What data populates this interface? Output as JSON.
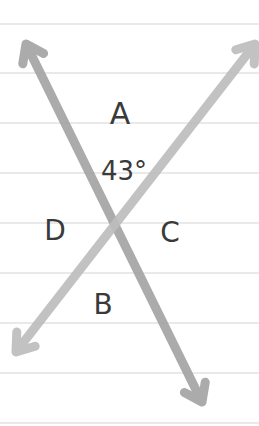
{
  "diagram": {
    "paper": {
      "background": "#ffffff",
      "rule_color": "#d4d4d4",
      "rule_y": [
        24,
        73,
        123,
        173,
        223,
        273,
        323,
        373,
        423
      ]
    },
    "lines": [
      {
        "name": "line-top-left-to-bottom-right",
        "from": [
          26,
          44
        ],
        "to": [
          202,
          402
        ],
        "color": "#a4a4a4"
      },
      {
        "name": "line-top-right-to-bottom-left",
        "from": [
          255,
          44
        ],
        "to": [
          16,
          352
        ],
        "color": "#bdbdbd"
      }
    ],
    "intersection": [
      114,
      226
    ],
    "labels": {
      "angle_a": {
        "text": "A",
        "x": 120,
        "y": 124
      },
      "angle_a_measure": {
        "text": "43°",
        "x": 124,
        "y": 180
      },
      "angle_d": {
        "text": "D",
        "x": 55,
        "y": 240
      },
      "angle_c": {
        "text": "C",
        "x": 170,
        "y": 242
      },
      "angle_b": {
        "text": "B",
        "x": 103,
        "y": 314
      }
    }
  }
}
